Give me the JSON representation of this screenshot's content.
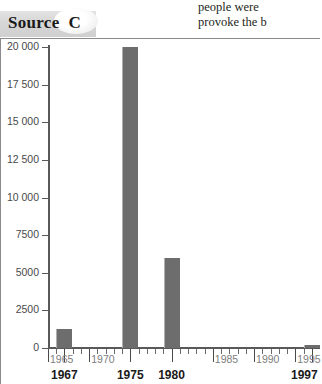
{
  "bleed_text": {
    "line1": "people were",
    "line2": "provoke the b"
  },
  "source_banner": {
    "word": "Source",
    "letter": "C"
  },
  "chart_data": {
    "type": "bar",
    "title": "",
    "xlabel": "",
    "ylabel": "",
    "x": [
      1967,
      1975,
      1980,
      1997
    ],
    "values": [
      1250,
      20000,
      6000,
      200
    ],
    "categories": [
      "1967",
      "1975",
      "1980",
      "1997"
    ],
    "xlim": [
      1965,
      1998
    ],
    "ylim": [
      0,
      20000
    ],
    "grid": false,
    "legend": null,
    "y_ticks": [
      {
        "value": 20000,
        "label": "20 000"
      },
      {
        "value": 17500,
        "label": "17 500"
      },
      {
        "value": 15000,
        "label": "15 000"
      },
      {
        "value": 12500,
        "label": "12 500"
      },
      {
        "value": 10000,
        "label": "10 000"
      },
      {
        "value": 7500,
        "label": "7500"
      },
      {
        "value": 5000,
        "label": "5000"
      },
      {
        "value": 2500,
        "label": "2500"
      },
      {
        "value": 0,
        "label": "0"
      }
    ],
    "x_ticks": [
      {
        "value": 1965,
        "label": "1965"
      },
      {
        "value": 1970,
        "label": "1970"
      },
      {
        "value": 1975,
        "label": ""
      },
      {
        "value": 1980,
        "label": ""
      },
      {
        "value": 1985,
        "label": "1985"
      },
      {
        "value": 1990,
        "label": "1990"
      },
      {
        "value": 1995,
        "label": "1995"
      }
    ],
    "x_labels_bold": [
      {
        "value": 1967,
        "label": "1967"
      },
      {
        "value": 1975,
        "label": "1975"
      },
      {
        "value": 1980,
        "label": "1980"
      },
      {
        "value": 1997,
        "label": "1997"
      }
    ],
    "colors": {
      "bar": "#6d6d6d",
      "axis": "#59595b",
      "tick_label": "#4a4a4a",
      "bold_label": "#1a1a1a",
      "banner": "#d6d6d6"
    }
  }
}
